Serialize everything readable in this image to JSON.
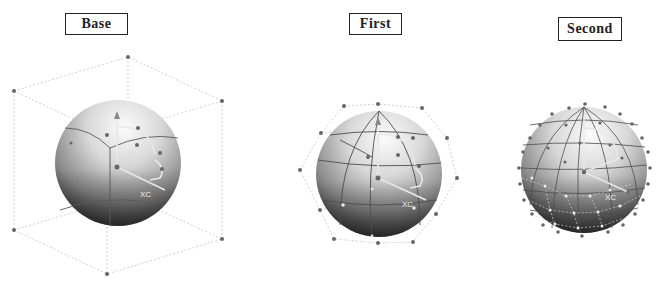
{
  "panels": [
    {
      "id": "base",
      "label": "Base",
      "axis_label": "XC",
      "mesh_level": 0
    },
    {
      "id": "first",
      "label": "First",
      "axis_label": "XC",
      "mesh_level": 1
    },
    {
      "id": "second",
      "label": "Second",
      "axis_label": "XC",
      "mesh_level": 2
    }
  ],
  "colors": {
    "label_border": "#222222",
    "sphere_light": "#f4f4f4",
    "sphere_dark": "#2a2a2a",
    "control_point": "#666666",
    "hull_line": "#bbbbbb",
    "grid_line": "#555555"
  }
}
